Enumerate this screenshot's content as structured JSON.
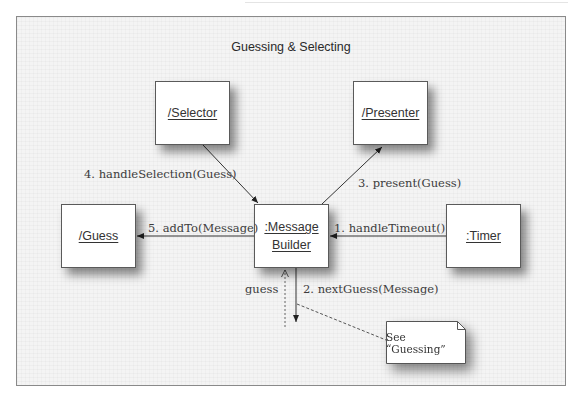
{
  "diagram": {
    "type": "UML communication diagram",
    "title": "Guessing & Selecting",
    "objects": [
      {
        "id": "selector",
        "label": "/Selector"
      },
      {
        "id": "presenter",
        "label": "/Presenter"
      },
      {
        "id": "guess",
        "label": "/Guess"
      },
      {
        "id": "message_builder",
        "label_line1": ":Message",
        "label_line2": "Builder"
      },
      {
        "id": "timer",
        "label": ":Timer"
      }
    ],
    "messages": [
      {
        "seq": 1,
        "label": "1. handleTimeout()",
        "from": "timer",
        "to": "message_builder"
      },
      {
        "seq": 2,
        "label": "2. nextGuess(Message)",
        "from": "message_builder",
        "to": "external"
      },
      {
        "seq": 3,
        "label": "3. present(Guess)",
        "from": "message_builder",
        "to": "presenter"
      },
      {
        "seq": 4,
        "label": "4. handleSelection(Guess)",
        "from": "selector",
        "to": "message_builder"
      },
      {
        "seq": 5,
        "label": "5. addTo(Message)",
        "from": "message_builder",
        "to": "guess"
      }
    ],
    "return_label": "guess",
    "note": "See “Guessing”",
    "colors": {
      "frame_border": "#8a8a8a",
      "frame_bg": "#f4f4f4",
      "box_border": "#5a5a5a",
      "line": "#333333"
    }
  }
}
